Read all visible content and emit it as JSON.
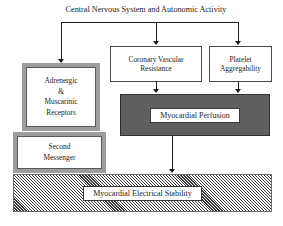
{
  "diagram": {
    "type": "flowchart",
    "title": "Central Nervous System and Autonomic Activity",
    "nodes": {
      "cns": {
        "label": "Central Nervous System and Autonomic Activity",
        "style": "plain-text"
      },
      "adrenergic": {
        "line1": "Adrenergic",
        "line2": "&",
        "line3": "Muscarinic",
        "line4": "Receptors",
        "style": "grey-framed-box"
      },
      "second_messenger": {
        "line1": "Second",
        "line2": "Messenger",
        "style": "grey-framed-box"
      },
      "coronary": {
        "line1": "Coronary Vascular",
        "line2": "Resistance",
        "style": "thin-white-box"
      },
      "platelet": {
        "line1": "Platelet",
        "line2": "Aggregability",
        "style": "thin-white-box"
      },
      "perfusion": {
        "label": "Myocardial Perfusion",
        "style": "dark-filled-box"
      },
      "stability": {
        "label": "Myocardial Electrical Stability",
        "style": "hatched-box"
      }
    },
    "edges": [
      {
        "from": "cns",
        "to": "adrenergic",
        "arrow": "down"
      },
      {
        "from": "cns",
        "to": "coronary",
        "arrow": "down"
      },
      {
        "from": "cns",
        "to": "platelet",
        "arrow": "down"
      },
      {
        "from": "coronary",
        "to": "perfusion",
        "arrow": "down"
      },
      {
        "from": "platelet",
        "to": "perfusion",
        "arrow": "down"
      },
      {
        "from": "perfusion",
        "to": "stability",
        "arrow": "down"
      }
    ],
    "colors": {
      "line": "#1d1d1d",
      "text": "#1d1d1d",
      "grey_frame": "#9d9d9d",
      "dark_fill": "#5f5f5f",
      "hatch": "#3a3a3a",
      "background": "#ffffff"
    }
  }
}
